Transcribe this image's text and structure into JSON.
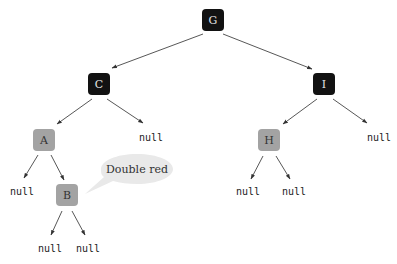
{
  "colors": {
    "black_node": "#121212",
    "red_node": "#a3a3a3",
    "black_text": "#e6e6e6",
    "red_text": "#333333",
    "edge": "#444444",
    "bubble_fill": "#e9e9e9"
  },
  "nodes": [
    {
      "id": "G",
      "label": "G",
      "color": "black",
      "x": 213,
      "y": 20
    },
    {
      "id": "C",
      "label": "C",
      "color": "black",
      "x": 99,
      "y": 84
    },
    {
      "id": "I",
      "label": "I",
      "color": "black",
      "x": 324,
      "y": 84
    },
    {
      "id": "A",
      "label": "A",
      "color": "red",
      "x": 44,
      "y": 140
    },
    {
      "id": "H",
      "label": "H",
      "color": "red",
      "x": 269,
      "y": 140
    },
    {
      "id": "B",
      "label": "B",
      "color": "red",
      "x": 67,
      "y": 195
    }
  ],
  "null_leaves": [
    {
      "parent": "C",
      "side": "right",
      "label": "null",
      "x": 151,
      "y": 138
    },
    {
      "parent": "I",
      "side": "right",
      "label": "null",
      "x": 379,
      "y": 138
    },
    {
      "parent": "A",
      "side": "left",
      "label": "null",
      "x": 22,
      "y": 192
    },
    {
      "parent": "H",
      "side": "left",
      "label": "null",
      "x": 248,
      "y": 192
    },
    {
      "parent": "H",
      "side": "right",
      "label": "null",
      "x": 294,
      "y": 192
    },
    {
      "parent": "B",
      "side": "left",
      "label": "null",
      "x": 50,
      "y": 249
    },
    {
      "parent": "B",
      "side": "right",
      "label": "null",
      "x": 88,
      "y": 249
    }
  ],
  "edges": [
    {
      "from": "G",
      "to": "C"
    },
    {
      "from": "G",
      "to": "I"
    },
    {
      "from": "C",
      "to": "A"
    },
    {
      "from": "C",
      "to": "null"
    },
    {
      "from": "I",
      "to": "H"
    },
    {
      "from": "I",
      "to": "null"
    },
    {
      "from": "A",
      "to": "null"
    },
    {
      "from": "A",
      "to": "B"
    },
    {
      "from": "H",
      "to": "null"
    },
    {
      "from": "H",
      "to": "null"
    },
    {
      "from": "B",
      "to": "null"
    },
    {
      "from": "B",
      "to": "null"
    }
  ],
  "callout": {
    "text": "Double red",
    "target": "B"
  }
}
